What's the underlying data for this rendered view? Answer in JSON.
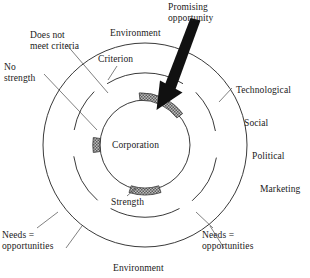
{
  "figure": {
    "background": "#ffffff",
    "ink": "#1a1a1a"
  },
  "labels": {
    "promising_opportunity": "Promising\nopportunity",
    "does_not_meet_criteria": "Does not\nmeet criteria",
    "no_strength": "No\nstrength",
    "environment_top": "Environment",
    "environment_bottom": "Environment",
    "criterion": "Criterion",
    "corporation": "Corporation",
    "strength": "Strength",
    "needs_left": "Needs =\nopportunities",
    "needs_right": "Needs =\nopportunities"
  },
  "environment_forces": [
    "Technological",
    "Social",
    "Political",
    "Marketing"
  ],
  "geometry": {
    "center_x": 145,
    "center_y": 145,
    "outer_radius": 102,
    "criterion_ring_radius": 72,
    "inner_radius": 45
  },
  "colors": {
    "arrow_fill": "#111111",
    "segment_fill": "#9a9a9a",
    "stroke": "#3a3a3a"
  },
  "segments": [
    {
      "name": "promising-opportunity-segment",
      "angle_deg": -75,
      "span_deg": 34,
      "style": "hatched"
    },
    {
      "name": "no-strength-segment",
      "angle_deg": 180,
      "span_deg": 18,
      "style": "hatched"
    },
    {
      "name": "strength-segment",
      "angle_deg": 90,
      "span_deg": 26,
      "style": "hatched"
    }
  ]
}
